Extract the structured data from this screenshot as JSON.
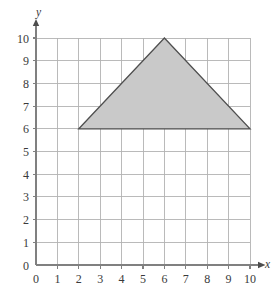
{
  "figure": {
    "axis_x_label": "x",
    "axis_y_label": "y"
  },
  "chart_data": {
    "type": "scatter",
    "title": "",
    "subtitle": "",
    "xlabel": "x",
    "ylabel": "y",
    "xlim": [
      0,
      10
    ],
    "ylim": [
      0,
      10
    ],
    "x_ticks": [
      0,
      1,
      2,
      3,
      4,
      5,
      6,
      7,
      8,
      9,
      10
    ],
    "y_ticks": [
      0,
      1,
      2,
      3,
      4,
      5,
      6,
      7,
      8,
      9,
      10
    ],
    "x_tick_labels": [
      "0",
      "1",
      "2",
      "3",
      "4",
      "5",
      "6",
      "7",
      "8",
      "9",
      "10"
    ],
    "y_tick_labels": [
      "0",
      "1",
      "2",
      "3",
      "4",
      "5",
      "6",
      "7",
      "8",
      "9",
      "10"
    ],
    "grid": true,
    "grid_spacing": 1,
    "legend": null,
    "legend_position": "none",
    "annotations": [],
    "shapes": [
      {
        "name": "triangle",
        "kind": "polygon",
        "vertices": [
          [
            2,
            6
          ],
          [
            6,
            10
          ],
          [
            10,
            6
          ]
        ],
        "fill": "#c9c9c9",
        "stroke": "#4f4f4f",
        "closed": true
      }
    ],
    "axis_style": {
      "x_axis_arrow": true,
      "y_axis_arrow": true,
      "axis_color": "#808080",
      "grid_color": "#b3b3b3",
      "background": "#ffffff"
    }
  },
  "colors": {
    "background": "#ffffff",
    "grid": "#b3b3b3",
    "axis": "#808080",
    "shape_fill": "#c9c9c9",
    "shape_stroke": "#4f4f4f",
    "text": "#3a3a3a"
  }
}
